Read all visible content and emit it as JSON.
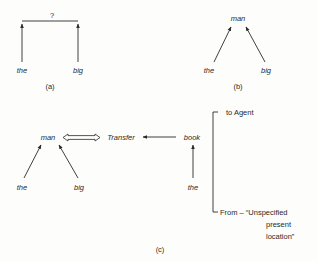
{
  "figure": {
    "panels": [
      {
        "id": "a",
        "caption": "(a)",
        "root": "?",
        "children": [
          "the",
          "big"
        ]
      },
      {
        "id": "b",
        "caption": "(b)",
        "root": "man",
        "children": [
          "the",
          "big"
        ]
      },
      {
        "id": "c",
        "caption": "(c)",
        "agent": {
          "head": "man",
          "modifiers": [
            "the",
            "big"
          ]
        },
        "action": "Transfer",
        "object": {
          "head": "book",
          "modifiers": [
            "the"
          ]
        },
        "cases": {
          "to": "to Agent",
          "from_line1": "From – “Unspecified",
          "from_line2": "present",
          "from_line3": "location”"
        }
      }
    ]
  },
  "colors": {
    "ink": "#2a2a2a",
    "paper": "#fdfdfb"
  }
}
